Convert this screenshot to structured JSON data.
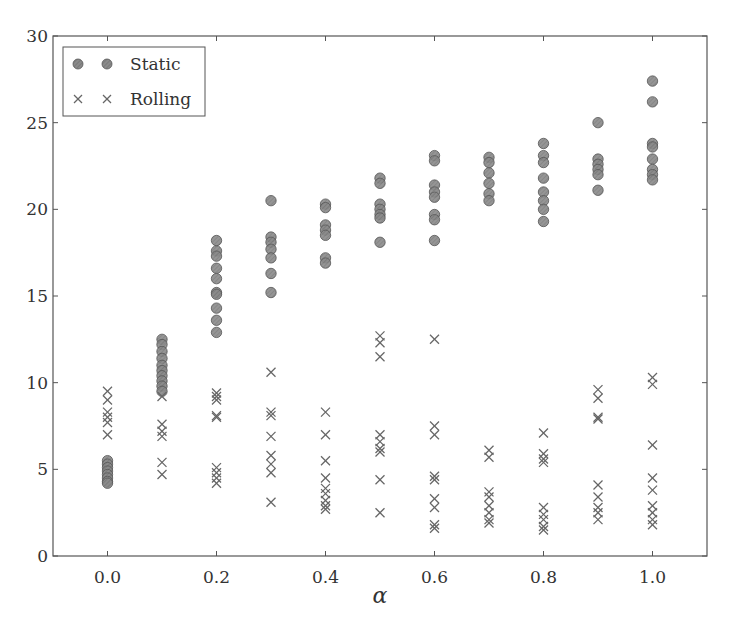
{
  "chart_data": {
    "type": "scatter",
    "title": "",
    "xlabel": "α",
    "ylabel": "",
    "xlim": [
      -0.1,
      1.1
    ],
    "ylim": [
      0,
      30
    ],
    "grid": false,
    "legend_position": "upper left",
    "x_ticks": [
      "0.0",
      "0.2",
      "0.4",
      "0.6",
      "0.8",
      "1.0"
    ],
    "y_ticks": [
      "0",
      "5",
      "10",
      "15",
      "20",
      "25",
      "30"
    ],
    "series": [
      {
        "name": "Static",
        "marker": "circle",
        "color": "#808080",
        "points": [
          [
            0.0,
            5.5
          ],
          [
            0.0,
            5.3
          ],
          [
            0.0,
            5.1
          ],
          [
            0.0,
            4.9
          ],
          [
            0.0,
            4.7
          ],
          [
            0.0,
            4.5
          ],
          [
            0.0,
            4.3
          ],
          [
            0.0,
            4.2
          ],
          [
            0.1,
            12.5
          ],
          [
            0.1,
            12.2
          ],
          [
            0.1,
            11.8
          ],
          [
            0.1,
            11.4
          ],
          [
            0.1,
            11.0
          ],
          [
            0.1,
            10.7
          ],
          [
            0.1,
            10.4
          ],
          [
            0.1,
            10.1
          ],
          [
            0.1,
            9.8
          ],
          [
            0.1,
            9.5
          ],
          [
            0.2,
            18.2
          ],
          [
            0.2,
            17.6
          ],
          [
            0.2,
            17.3
          ],
          [
            0.2,
            16.6
          ],
          [
            0.2,
            16.0
          ],
          [
            0.2,
            15.2
          ],
          [
            0.2,
            15.1
          ],
          [
            0.2,
            14.3
          ],
          [
            0.2,
            13.6
          ],
          [
            0.2,
            12.9
          ],
          [
            0.3,
            20.5
          ],
          [
            0.3,
            18.4
          ],
          [
            0.3,
            18.1
          ],
          [
            0.3,
            17.7
          ],
          [
            0.3,
            17.2
          ],
          [
            0.3,
            16.3
          ],
          [
            0.3,
            15.2
          ],
          [
            0.4,
            20.3
          ],
          [
            0.4,
            20.1
          ],
          [
            0.4,
            19.1
          ],
          [
            0.4,
            18.8
          ],
          [
            0.4,
            18.5
          ],
          [
            0.4,
            17.2
          ],
          [
            0.4,
            16.9
          ],
          [
            0.5,
            21.8
          ],
          [
            0.5,
            21.5
          ],
          [
            0.5,
            20.3
          ],
          [
            0.5,
            20.0
          ],
          [
            0.5,
            19.7
          ],
          [
            0.5,
            19.5
          ],
          [
            0.5,
            18.1
          ],
          [
            0.6,
            23.1
          ],
          [
            0.6,
            22.8
          ],
          [
            0.6,
            21.4
          ],
          [
            0.6,
            21.0
          ],
          [
            0.6,
            20.7
          ],
          [
            0.6,
            19.7
          ],
          [
            0.6,
            19.4
          ],
          [
            0.6,
            18.2
          ],
          [
            0.7,
            23.0
          ],
          [
            0.7,
            22.7
          ],
          [
            0.7,
            22.1
          ],
          [
            0.7,
            21.5
          ],
          [
            0.7,
            20.9
          ],
          [
            0.7,
            20.5
          ],
          [
            0.8,
            23.8
          ],
          [
            0.8,
            23.1
          ],
          [
            0.8,
            22.7
          ],
          [
            0.8,
            21.8
          ],
          [
            0.8,
            21.0
          ],
          [
            0.8,
            20.5
          ],
          [
            0.8,
            20.0
          ],
          [
            0.8,
            19.3
          ],
          [
            0.9,
            25.0
          ],
          [
            0.9,
            22.9
          ],
          [
            0.9,
            22.6
          ],
          [
            0.9,
            22.3
          ],
          [
            0.9,
            22.0
          ],
          [
            0.9,
            21.1
          ],
          [
            1.0,
            27.4
          ],
          [
            1.0,
            26.2
          ],
          [
            1.0,
            23.8
          ],
          [
            1.0,
            23.6
          ],
          [
            1.0,
            22.9
          ],
          [
            1.0,
            22.3
          ],
          [
            1.0,
            22.0
          ],
          [
            1.0,
            21.7
          ]
        ]
      },
      {
        "name": "Rolling",
        "marker": "x",
        "color": "#6e6e6e",
        "points": [
          [
            0.0,
            9.5
          ],
          [
            0.0,
            9.0
          ],
          [
            0.0,
            8.3
          ],
          [
            0.0,
            8.0
          ],
          [
            0.0,
            7.7
          ],
          [
            0.0,
            7.0
          ],
          [
            0.1,
            9.2
          ],
          [
            0.1,
            7.6
          ],
          [
            0.1,
            7.2
          ],
          [
            0.1,
            6.9
          ],
          [
            0.1,
            5.4
          ],
          [
            0.1,
            4.7
          ],
          [
            0.2,
            9.4
          ],
          [
            0.2,
            9.2
          ],
          [
            0.2,
            9.0
          ],
          [
            0.2,
            8.1
          ],
          [
            0.2,
            8.0
          ],
          [
            0.2,
            5.1
          ],
          [
            0.2,
            4.8
          ],
          [
            0.2,
            4.5
          ],
          [
            0.2,
            4.2
          ],
          [
            0.3,
            10.6
          ],
          [
            0.3,
            8.3
          ],
          [
            0.3,
            8.1
          ],
          [
            0.3,
            6.9
          ],
          [
            0.3,
            5.8
          ],
          [
            0.3,
            5.3
          ],
          [
            0.3,
            4.8
          ],
          [
            0.3,
            3.1
          ],
          [
            0.4,
            8.3
          ],
          [
            0.4,
            7.0
          ],
          [
            0.4,
            5.5
          ],
          [
            0.4,
            4.5
          ],
          [
            0.4,
            3.9
          ],
          [
            0.4,
            3.6
          ],
          [
            0.4,
            3.2
          ],
          [
            0.4,
            2.9
          ],
          [
            0.4,
            2.7
          ],
          [
            0.5,
            12.7
          ],
          [
            0.5,
            12.3
          ],
          [
            0.5,
            11.5
          ],
          [
            0.5,
            7.0
          ],
          [
            0.5,
            6.6
          ],
          [
            0.5,
            6.2
          ],
          [
            0.5,
            6.0
          ],
          [
            0.5,
            4.4
          ],
          [
            0.5,
            2.5
          ],
          [
            0.6,
            12.5
          ],
          [
            0.6,
            7.5
          ],
          [
            0.6,
            7.0
          ],
          [
            0.6,
            4.6
          ],
          [
            0.6,
            4.4
          ],
          [
            0.6,
            3.3
          ],
          [
            0.6,
            2.8
          ],
          [
            0.6,
            1.8
          ],
          [
            0.6,
            1.6
          ],
          [
            0.7,
            6.1
          ],
          [
            0.7,
            5.7
          ],
          [
            0.7,
            3.7
          ],
          [
            0.7,
            3.4
          ],
          [
            0.7,
            2.9
          ],
          [
            0.7,
            2.5
          ],
          [
            0.7,
            2.1
          ],
          [
            0.7,
            1.9
          ],
          [
            0.8,
            7.1
          ],
          [
            0.8,
            5.9
          ],
          [
            0.8,
            5.6
          ],
          [
            0.8,
            5.4
          ],
          [
            0.8,
            2.8
          ],
          [
            0.8,
            2.4
          ],
          [
            0.8,
            2.1
          ],
          [
            0.8,
            1.7
          ],
          [
            0.8,
            1.5
          ],
          [
            0.9,
            9.6
          ],
          [
            0.9,
            9.1
          ],
          [
            0.9,
            8.0
          ],
          [
            0.9,
            7.9
          ],
          [
            0.9,
            4.1
          ],
          [
            0.9,
            3.4
          ],
          [
            0.9,
            2.8
          ],
          [
            0.9,
            2.5
          ],
          [
            0.9,
            2.1
          ],
          [
            1.0,
            10.3
          ],
          [
            1.0,
            9.9
          ],
          [
            1.0,
            6.4
          ],
          [
            1.0,
            4.5
          ],
          [
            1.0,
            3.8
          ],
          [
            1.0,
            2.9
          ],
          [
            1.0,
            2.5
          ],
          [
            1.0,
            2.1
          ],
          [
            1.0,
            1.8
          ]
        ]
      }
    ]
  },
  "legend": {
    "items": [
      {
        "label": "Static",
        "marker": "circle"
      },
      {
        "label": "Rolling",
        "marker": "x"
      }
    ]
  },
  "axes": {
    "xlabel": "α"
  }
}
